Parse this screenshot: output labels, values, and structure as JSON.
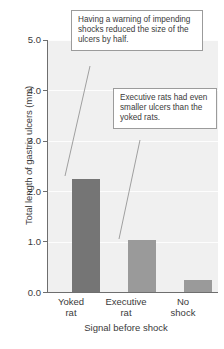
{
  "chart_data": {
    "type": "bar",
    "title": "",
    "subtitle": "",
    "xlabel": "Signal before shock",
    "ylabel": "Total length of gastric ulcers (mm)",
    "categories": [
      "Yoked rat",
      "Executive rat",
      "No shock"
    ],
    "category_lines": [
      [
        "Yoked",
        "rat"
      ],
      [
        "Executive",
        "rat"
      ],
      [
        "No",
        "shock"
      ]
    ],
    "values": [
      2.25,
      1.03,
      0.24
    ],
    "ylim": [
      0.0,
      5.0
    ],
    "ytick_labels": [
      "0.0",
      "1.0",
      "2.0",
      "3.0",
      "4.0",
      "5.0"
    ],
    "ytick_values": [
      0.0,
      1.0,
      2.0,
      3.0,
      4.0,
      5.0
    ],
    "grid": true,
    "legend": "none",
    "bar_colors": [
      "#757575",
      "#9a9a9a",
      "#9a9a9a"
    ],
    "plot_background": "#f0f0f0",
    "gridline_color": "#fdfdfd",
    "axis_color": "#6e6e6e",
    "annotations": [
      {
        "id": "callout-1",
        "text": "Having a warning of impending shocks reduced the size of the ulcers by half.",
        "points_to": "Yoked rat"
      },
      {
        "id": "callout-2",
        "text": "Executive rats had even smaller ulcers than the yoked rats.",
        "points_to": "Executive rat"
      }
    ]
  }
}
